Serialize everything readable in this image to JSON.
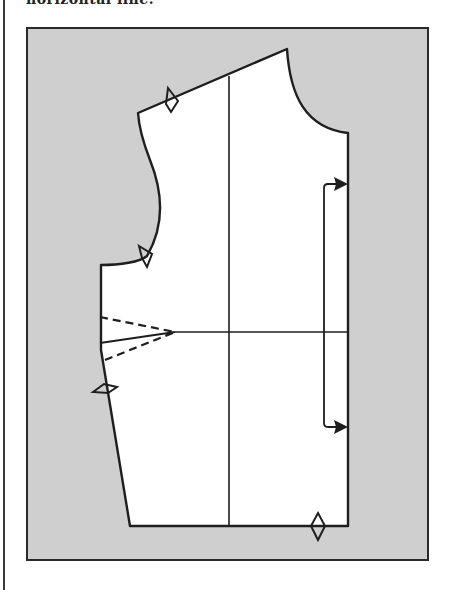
{
  "caption": {
    "text_cut_off": "horizontal line."
  },
  "figure": {
    "type": "sewing-pattern-bodice-front",
    "colors": {
      "background_panel": "#cfcfcf",
      "pattern_fill": "#ffffff",
      "line": "#1e1e1e",
      "page": "#ffffff"
    },
    "elements": {
      "pattern_piece": "bodice front outline",
      "grain_line": "vertical line",
      "horizontal_line": "horizontal reference line",
      "dart": "side bust dart (dashed legs)",
      "notches": [
        "shoulder notch",
        "armhole notch",
        "side seam notch",
        "hem notch"
      ],
      "bracket_arrow": "double-headed bracket along center front"
    }
  }
}
